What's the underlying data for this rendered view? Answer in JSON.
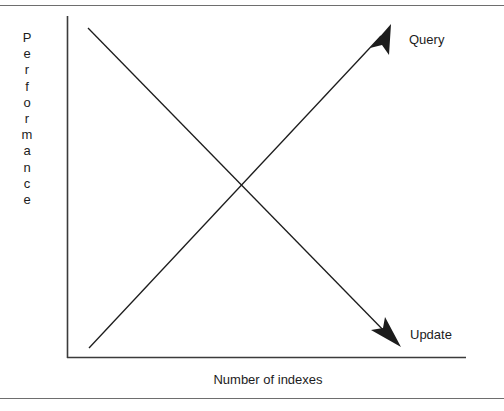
{
  "figure": {
    "axes": {
      "ylabel": "Performance",
      "xlabel": "Number of indexes"
    },
    "series_labels": {
      "query": "Query",
      "update": "Update"
    },
    "colors": {
      "line": "#1c1c1c",
      "axis": "#3b3b3b",
      "rule": "#6e6e6e",
      "text": "#1c1c1c",
      "background": "#ffffff"
    }
  },
  "chart_data": {
    "type": "line",
    "title": "",
    "subtitle": "",
    "xlabel": "Number of indexes",
    "ylabel": "Performance",
    "xlim": [
      0,
      100
    ],
    "ylim": [
      0,
      100
    ],
    "grid": false,
    "axis_ticks": {
      "x": [],
      "y": []
    },
    "legend": {
      "position": "right-inline-annotations",
      "entries": [
        "Query",
        "Update"
      ]
    },
    "series": [
      {
        "name": "Query",
        "trend": "increasing",
        "arrow": "up-right",
        "x": [
          0,
          100
        ],
        "values": [
          5,
          95
        ],
        "annotation": "Query"
      },
      {
        "name": "Update",
        "trend": "decreasing",
        "arrow": "down-right",
        "x": [
          0,
          100
        ],
        "values": [
          95,
          5
        ],
        "annotation": "Update"
      }
    ],
    "annotations": [
      "Query performance increases as the number of indexes grows",
      "Update performance decreases as the number of indexes grows"
    ]
  }
}
